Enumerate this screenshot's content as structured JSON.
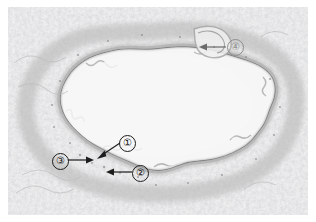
{
  "figure": {
    "kind": "histology-micrograph",
    "specimen": "blood vessel cross-section in lung tissue",
    "stain_tone": "pale grey / unstained light microscopy",
    "background_color": "#ffffff",
    "lumen_color": "#f2f2f2",
    "wall_color": "#9a9a9a",
    "tissue_color": "#c9c9c9",
    "annotation_color": "#1c1c1c"
  },
  "annotations": [
    {
      "id": "label-4",
      "marker": "④",
      "digit": "4",
      "faint": true,
      "arrow_direction": "left",
      "badge_left": 219,
      "badge_top": 32,
      "arrow_x1": 216,
      "arrow_y1": 40,
      "arrow_x2": 194,
      "arrow_y2": 40
    },
    {
      "id": "label-1",
      "marker": "①",
      "digit": "1",
      "faint": false,
      "arrow_direction": "down-left",
      "badge_left": 111,
      "badge_top": 128,
      "arrow_x1": 110,
      "arrow_y1": 138,
      "arrow_x2": 90,
      "arrow_y2": 149
    },
    {
      "id": "label-3",
      "marker": "③",
      "digit": "3",
      "faint": false,
      "arrow_direction": "right",
      "badge_left": 44,
      "badge_top": 146,
      "arrow_x1": 61,
      "arrow_y1": 153,
      "arrow_x2": 83,
      "arrow_y2": 153
    },
    {
      "id": "label-2",
      "marker": "②",
      "digit": "2",
      "faint": false,
      "arrow_direction": "left",
      "badge_left": 124,
      "badge_top": 158,
      "arrow_x1": 122,
      "arrow_y1": 165,
      "arrow_x2": 100,
      "arrow_y2": 165
    }
  ]
}
